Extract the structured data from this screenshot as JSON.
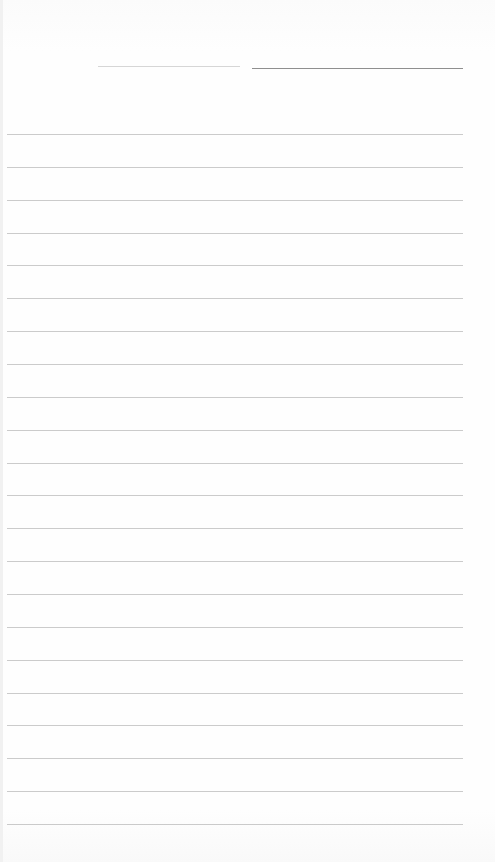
{
  "document": {
    "type": "blank lined paper",
    "text": "",
    "header_line": {
      "x1": 252,
      "x2": 463,
      "y": 68,
      "color": "#8f8f8f"
    },
    "faint_mark": {
      "x1": 98,
      "x2": 240,
      "y": 66,
      "color": "#d6d6d6"
    },
    "ruling": {
      "count": 22,
      "first_y": 134,
      "spacing": 32.86,
      "x1": 7,
      "x2": 463,
      "color": "#b9b9b9"
    }
  }
}
